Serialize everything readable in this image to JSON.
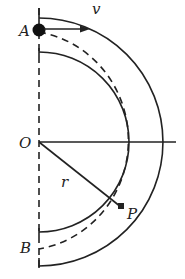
{
  "diagram": {
    "labels": {
      "A": "A",
      "B": "B",
      "O": "O",
      "P": "P",
      "v": "v",
      "r": "r"
    },
    "geometry": {
      "center": [
        39,
        142
      ],
      "outer_radius": 124,
      "inner_radius": 90,
      "mid_radius": 107
    },
    "colors": {
      "line": "#222222",
      "background": "#ffffff"
    }
  }
}
